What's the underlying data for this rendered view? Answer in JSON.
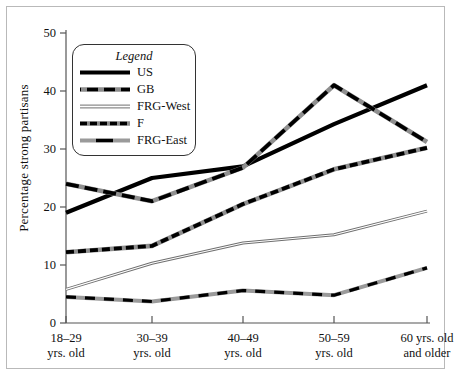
{
  "chart_data": {
    "type": "line",
    "title": "",
    "xlabel": "",
    "ylabel": "Percentage strong partisans",
    "categories": [
      "18–29 yrs. old",
      "30–39 yrs. old",
      "40–49 yrs. old",
      "50–59 yrs. old",
      "60 yrs. old and older"
    ],
    "x_tick_lines": [
      [
        "18–29",
        "yrs. old"
      ],
      [
        "30–39",
        "yrs. old"
      ],
      [
        "40–49",
        "yrs. old"
      ],
      [
        "50–59",
        "yrs. old"
      ],
      [
        "60 yrs. old",
        "and older"
      ]
    ],
    "ylim": [
      0,
      50
    ],
    "yticks": [
      0,
      10,
      20,
      30,
      40,
      50
    ],
    "ytick_labels": [
      "0",
      "10",
      "20",
      "30",
      "40",
      "50"
    ],
    "grid": false,
    "legend_position": "upper-left-inside",
    "legend_title": "Legend",
    "series": [
      {
        "name": "US",
        "values": [
          19.0,
          25.0,
          27.0,
          34.3,
          41.0
        ],
        "style": "solid-thick",
        "color": "#000000"
      },
      {
        "name": "GB",
        "values": [
          24.0,
          21.0,
          26.8,
          41.0,
          31.2
        ],
        "style": "long-dash",
        "color": "#000000"
      },
      {
        "name": "FRG-West",
        "values": [
          5.8,
          10.3,
          13.8,
          15.2,
          19.3
        ],
        "style": "thin-double",
        "color": "#7a7a7a"
      },
      {
        "name": "F",
        "values": [
          12.2,
          13.3,
          20.5,
          26.5,
          30.2
        ],
        "style": "short-dash",
        "color": "#000000"
      },
      {
        "name": "FRG-East",
        "values": [
          4.5,
          3.7,
          5.6,
          4.8,
          9.5
        ],
        "style": "dash-light",
        "color": "#000000"
      }
    ]
  },
  "axis": {
    "y_title": "Percentage strong partisans"
  }
}
